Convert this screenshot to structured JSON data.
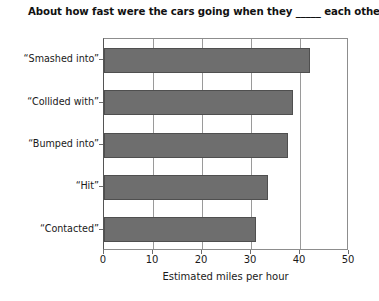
{
  "chart_data": {
    "type": "bar",
    "orientation": "horizontal",
    "title": "About how fast were the cars going when they _____ each other?",
    "xlabel": "Estimated miles per hour",
    "ylabel": "",
    "categories": [
      "“Smashed into”",
      "“Collided with”",
      "“Bumped into”",
      "“Hit”",
      "“Contacted”"
    ],
    "values": [
      42.0,
      38.5,
      37.5,
      33.5,
      31.0
    ],
    "xlim": [
      0,
      50
    ],
    "xticks": [
      0,
      10,
      20,
      30,
      40,
      50
    ],
    "xtick_labels": [
      "0",
      "10",
      "20",
      "30",
      "40",
      "50"
    ],
    "grid": "vertical",
    "legend": "none",
    "bar_color": "#6e6e6e",
    "bar_edge_color": "#4f4f4f",
    "frame_color": "#8d8d8d",
    "gridline_color": "#9a9a9a",
    "background": "#ffffff"
  }
}
